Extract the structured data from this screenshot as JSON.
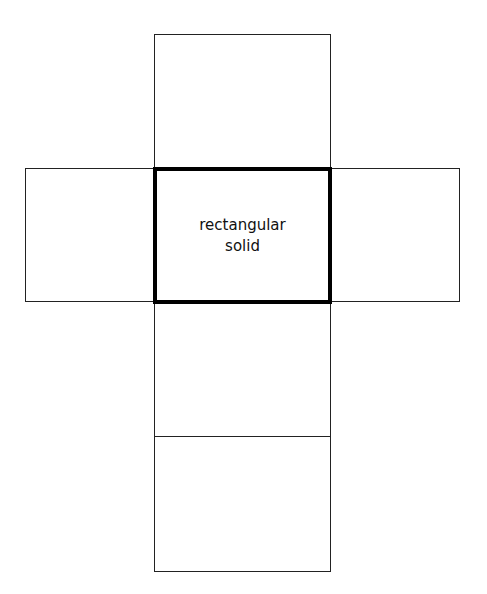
{
  "diagram": {
    "type": "net",
    "center_face": {
      "label_line1": "rectangular",
      "label_line2": "solid"
    },
    "faces": [
      "top",
      "left",
      "center",
      "right",
      "bottom-1",
      "bottom-2"
    ],
    "colors": {
      "stroke": "#000000",
      "background": "#ffffff"
    }
  }
}
